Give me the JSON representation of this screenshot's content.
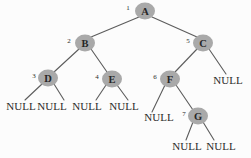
{
  "diagram": {
    "background_color": "#fcfcfc",
    "node_fill_color": "#a9a9a9",
    "edge_color": "#5c5c5c",
    "text_color": "#2b2b2b",
    "null_label": "NULL"
  },
  "nodes": [
    {
      "id": "A",
      "label": "A",
      "index": "1",
      "cx": 145,
      "cy": 11,
      "r": 8.5,
      "index_x": 128,
      "index_y": 8
    },
    {
      "id": "B",
      "label": "B",
      "index": "2",
      "cx": 85,
      "cy": 43,
      "r": 8.5,
      "index_x": 69,
      "index_y": 41
    },
    {
      "id": "C",
      "label": "C",
      "index": "5",
      "cx": 203,
      "cy": 43,
      "r": 8.5,
      "index_x": 188,
      "index_y": 41
    },
    {
      "id": "D",
      "label": "D",
      "index": "3",
      "cx": 48,
      "cy": 78,
      "r": 8.5,
      "index_x": 34,
      "index_y": 76
    },
    {
      "id": "E",
      "label": "E",
      "index": "4",
      "cx": 112,
      "cy": 79,
      "r": 8.5,
      "index_x": 97,
      "index_y": 77
    },
    {
      "id": "F",
      "label": "F",
      "index": "6",
      "cx": 170,
      "cy": 79,
      "r": 8.5,
      "index_x": 155,
      "index_y": 77
    },
    {
      "id": "G",
      "label": "G",
      "index": "7",
      "cx": 198,
      "cy": 116,
      "r": 8.5,
      "index_x": 184,
      "index_y": 114
    }
  ],
  "null_leaves": [
    {
      "id": "null-d-left",
      "text": "NULL",
      "x": 21,
      "y": 110
    },
    {
      "id": "null-d-right",
      "text": "NULL",
      "x": 52,
      "y": 110
    },
    {
      "id": "null-e-left",
      "text": "NULL",
      "x": 87,
      "y": 110
    },
    {
      "id": "null-e-right",
      "text": "NULL",
      "x": 124,
      "y": 110
    },
    {
      "id": "null-c-right",
      "text": "NULL",
      "x": 228,
      "y": 84
    },
    {
      "id": "null-f-left",
      "text": "NULL",
      "x": 159,
      "y": 121
    },
    {
      "id": "null-g-left",
      "text": "NULL",
      "x": 187,
      "y": 150
    },
    {
      "id": "null-g-right",
      "text": "NULL",
      "x": 221,
      "y": 150
    }
  ],
  "edges": [
    {
      "id": "edge-a-b",
      "from": "A",
      "to": "B",
      "x1": 139,
      "y1": 17,
      "x2": 91,
      "y2": 37
    },
    {
      "id": "edge-a-c",
      "from": "A",
      "to": "C",
      "x1": 152,
      "y1": 17,
      "x2": 197,
      "y2": 37
    },
    {
      "id": "edge-b-d",
      "from": "B",
      "to": "D",
      "x1": 79,
      "y1": 49,
      "x2": 54,
      "y2": 72
    },
    {
      "id": "edge-b-e",
      "from": "B",
      "to": "E",
      "x1": 91,
      "y1": 49,
      "x2": 107,
      "y2": 72
    },
    {
      "id": "edge-c-f",
      "from": "C",
      "to": "F",
      "x1": 197,
      "y1": 49,
      "x2": 175,
      "y2": 72
    },
    {
      "id": "edge-c-null",
      "from": "C",
      "to": "null-c-right",
      "x1": 209,
      "y1": 49,
      "x2": 226,
      "y2": 74
    },
    {
      "id": "edge-d-null-left",
      "from": "D",
      "to": "null-d-left",
      "x1": 42,
      "y1": 84,
      "x2": 25,
      "y2": 100
    },
    {
      "id": "edge-d-null-right",
      "from": "D",
      "to": "null-d-right",
      "x1": 54,
      "y1": 84,
      "x2": 64,
      "y2": 100
    },
    {
      "id": "edge-e-null-left",
      "from": "E",
      "to": "null-e-left",
      "x1": 106,
      "y1": 85,
      "x2": 96,
      "y2": 100
    },
    {
      "id": "edge-e-null-right",
      "from": "E",
      "to": "null-e-right",
      "x1": 117,
      "y1": 85,
      "x2": 128,
      "y2": 100
    },
    {
      "id": "edge-f-null-left",
      "from": "F",
      "to": "null-f-left",
      "x1": 165,
      "y1": 85,
      "x2": 152,
      "y2": 112
    },
    {
      "id": "edge-f-g",
      "from": "F",
      "to": "G",
      "x1": 176,
      "y1": 85,
      "x2": 193,
      "y2": 110
    },
    {
      "id": "edge-g-null-left",
      "from": "G",
      "to": "null-g-left",
      "x1": 193,
      "y1": 122,
      "x2": 186,
      "y2": 140
    },
    {
      "id": "edge-g-null-right",
      "from": "G",
      "to": "null-g-right",
      "x1": 203,
      "y1": 122,
      "x2": 214,
      "y2": 140
    }
  ]
}
